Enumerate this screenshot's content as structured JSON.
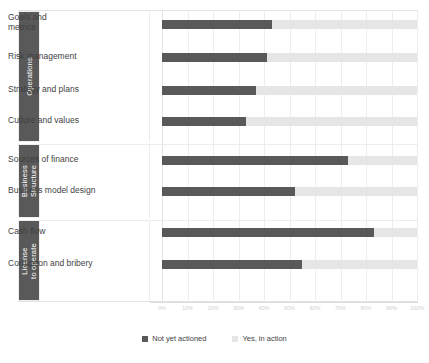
{
  "chart_data": {
    "type": "bar",
    "orientation": "horizontal",
    "stacked": true,
    "title": "",
    "xlabel": "",
    "ylabel": "",
    "xlim": [
      0,
      100
    ],
    "grid": true,
    "legend_position": "bottom",
    "tick_labels": [
      "0%",
      "10%",
      "20%",
      "30%",
      "40%",
      "50%",
      "60%",
      "70%",
      "80%",
      "90%",
      "100%"
    ],
    "tick_values": [
      0,
      10,
      20,
      30,
      40,
      50,
      60,
      70,
      80,
      90,
      100
    ],
    "series": [
      {
        "name": "Not yet actioned",
        "color": "#595959",
        "values": [
          43,
          41,
          37,
          33,
          73,
          52,
          83,
          55
        ]
      },
      {
        "name": "Yes, in action",
        "color": "#e6e6e6",
        "values": [
          57,
          59,
          63,
          67,
          27,
          48,
          17,
          45
        ]
      }
    ],
    "categories": [
      "Goals and\nmetrics",
      "Risk management",
      "Strategy and plans",
      "Culture and values",
      "Sources of finance",
      "Business model design",
      "Cash flow",
      "Corruption and bribery"
    ],
    "groups": [
      {
        "label": "Operations",
        "rows": [
          0,
          1,
          2,
          3
        ]
      },
      {
        "label": "Business\nStructure",
        "rows": [
          4,
          5
        ]
      },
      {
        "label": "License\nto operate",
        "rows": [
          6,
          7
        ]
      }
    ]
  },
  "legend": {
    "items": [
      {
        "label": "Not yet actioned",
        "color": "#595959"
      },
      {
        "label": "Yes, in action",
        "color": "#e6e6e6"
      }
    ]
  }
}
